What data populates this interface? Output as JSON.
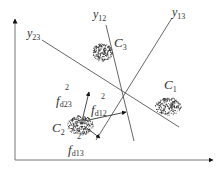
{
  "diagram": {
    "type": "multi-class decision boundaries with distance vectors",
    "axes": {
      "x_axis": "horizontal axis with arrow",
      "y_axis": "vertical axis with arrow"
    },
    "boundaries": [
      {
        "id": "y12",
        "label": "y",
        "sub": "12"
      },
      {
        "id": "y13",
        "label": "y",
        "sub": "13"
      },
      {
        "id": "y23",
        "label": "y",
        "sub": "23"
      }
    ],
    "clusters": [
      {
        "id": "C1",
        "label": "C",
        "sub": "1"
      },
      {
        "id": "C2",
        "label": "C",
        "sub": "2"
      },
      {
        "id": "C3",
        "label": "C",
        "sub": "3"
      }
    ],
    "distances": [
      {
        "id": "fd23",
        "base": "f",
        "sup": "2",
        "sub": "d23"
      },
      {
        "id": "fd12",
        "base": "f",
        "sup": "2",
        "sub": "d12"
      },
      {
        "id": "fd13",
        "base": "f",
        "sup": "2",
        "sub": "d13"
      }
    ],
    "colors": {
      "line": "#555555",
      "axis": "#777777",
      "dots": "#222222",
      "arrow": "#111111"
    }
  }
}
